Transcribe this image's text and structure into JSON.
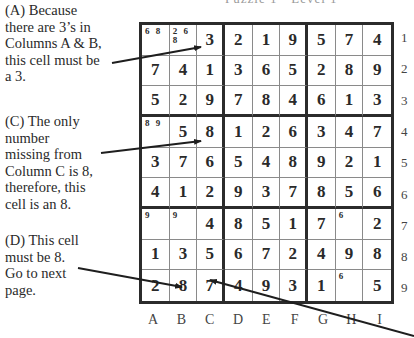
{
  "header": {
    "text": "Puzzle 1 - Level 1"
  },
  "notes": [
    {
      "id": "A",
      "lines": [
        "(A) Because",
        "there are 3’s in",
        "Columns A & B,",
        "this cell must be",
        "a 3."
      ]
    },
    {
      "id": "C",
      "lines": [
        "(C) The only",
        "number",
        "missing from",
        "Column C is 8,",
        "therefore, this",
        "cell is an 8."
      ]
    },
    {
      "id": "D",
      "lines": [
        "(D) This cell",
        "must be 8.",
        "Go to next",
        "page."
      ]
    }
  ],
  "grid": {
    "rows": [
      [
        "",
        "",
        "3",
        "2",
        "1",
        "9",
        "5",
        "7",
        "4"
      ],
      [
        "7",
        "4",
        "1",
        "3",
        "6",
        "5",
        "2",
        "8",
        "9"
      ],
      [
        "5",
        "2",
        "9",
        "7",
        "8",
        "4",
        "6",
        "1",
        "3"
      ],
      [
        "",
        "5",
        "8",
        "1",
        "2",
        "6",
        "3",
        "4",
        "7"
      ],
      [
        "3",
        "7",
        "6",
        "5",
        "4",
        "8",
        "9",
        "2",
        "1"
      ],
      [
        "4",
        "1",
        "2",
        "9",
        "3",
        "7",
        "8",
        "5",
        "6"
      ],
      [
        "",
        "",
        "4",
        "8",
        "5",
        "1",
        "7",
        "",
        "2"
      ],
      [
        "1",
        "3",
        "5",
        "6",
        "7",
        "2",
        "4",
        "9",
        "8"
      ],
      [
        "2",
        "8",
        "7",
        "4",
        "9",
        "3",
        "1",
        "",
        "5"
      ]
    ],
    "pencil_marks": [
      {
        "row": 1,
        "col": 1,
        "text": "6 8"
      },
      {
        "row": 1,
        "col": 2,
        "text": "2 6\n8"
      },
      {
        "row": 4,
        "col": 1,
        "text": "8 9"
      },
      {
        "row": 7,
        "col": 1,
        "text": "9"
      },
      {
        "row": 7,
        "col": 2,
        "text": "9"
      },
      {
        "row": 7,
        "col": 8,
        "text": "6"
      },
      {
        "row": 9,
        "col": 8,
        "text": "6"
      }
    ],
    "row_labels": [
      "1",
      "2",
      "3",
      "4",
      "5",
      "6",
      "7",
      "8",
      "9"
    ],
    "col_labels": [
      "A",
      "B",
      "C",
      "D",
      "E",
      "F",
      "G",
      "H",
      "I"
    ]
  }
}
